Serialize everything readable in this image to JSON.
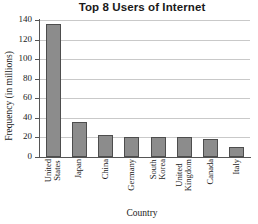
{
  "chart_data": {
    "type": "bar",
    "title": "Top 8 Users of Internet",
    "xlabel": "Country",
    "ylabel": "Frequency (in millions)",
    "categories": [
      "United States",
      "Japan",
      "China",
      "Germany",
      "South Korea",
      "United Kingdom",
      "Canada",
      "Italy"
    ],
    "category_lines": [
      [
        "United",
        "States"
      ],
      [
        "Japan"
      ],
      [
        "China"
      ],
      [
        "Germany"
      ],
      [
        "South",
        "Korea"
      ],
      [
        "United",
        "Kingdom"
      ],
      [
        "Canada"
      ],
      [
        "Italy"
      ]
    ],
    "values": [
      136,
      35.5,
      22,
      20,
      20.5,
      20,
      18,
      10
    ],
    "ylim": [
      0,
      140
    ],
    "yticks": [
      0,
      20,
      40,
      60,
      80,
      100,
      120,
      140
    ],
    "ytick_labels": [
      "0",
      "20",
      "40",
      "60",
      "80",
      "100",
      "120",
      "140"
    ],
    "grid": true,
    "grid_axis": "y",
    "legend": false,
    "bar_color": "#8c8c8c",
    "bar_edge_color": "#4d4d4d",
    "gridline_color": "#c9c9c9",
    "axis_color": "#555555",
    "text_color": "#1a1a1a",
    "background_color": "#ffffff"
  }
}
